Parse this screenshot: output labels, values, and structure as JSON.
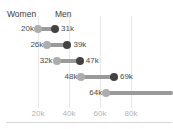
{
  "chart_data": {
    "type": "bar",
    "subtype": "dumbbell-range",
    "title": "",
    "xlabel": "",
    "ylabel": "",
    "xlim": [
      0,
      90000
    ],
    "grid": true,
    "legend_position": "top-inline",
    "categories": [
      "row-1",
      "row-2",
      "row-3",
      "row-4",
      "row-5"
    ],
    "series": [
      {
        "name": "Women",
        "color": "#adadad",
        "values": [
          20000,
          26000,
          32000,
          48000,
          64000
        ]
      },
      {
        "name": "Men",
        "color": "#434343",
        "values": [
          31000,
          39000,
          47000,
          69000,
          null
        ]
      }
    ],
    "point_labels": {
      "women": [
        "20k",
        "26k",
        "32k",
        "48k",
        "64k"
      ],
      "men": [
        "31k",
        "39k",
        "47k",
        "69k",
        ""
      ]
    },
    "xticks": [
      20000,
      40000,
      60000,
      80000
    ],
    "xticklabels": [
      "20k",
      "40k",
      "60k",
      "80k"
    ]
  },
  "legend": {
    "women_label": "Women",
    "men_label": "Men"
  },
  "rows": [
    {
      "women_label": "20k",
      "men_label": "31k"
    },
    {
      "women_label": "26k",
      "men_label": "39k"
    },
    {
      "women_label": "32k",
      "men_label": "47k"
    },
    {
      "women_label": "48k",
      "men_label": "69k"
    },
    {
      "women_label": "64k",
      "men_label": ""
    }
  ],
  "axis": {
    "ticks": [
      "20k",
      "40k",
      "60k",
      "80k"
    ]
  },
  "colors": {
    "women_dot": "#adadad",
    "men_dot": "#434343",
    "connector": "#9a9a9a",
    "gridline": "#e8e8e8",
    "tick_text": "#b4b4b4",
    "value_text": "#4a4a4a",
    "legend_text": "#3d3d3d",
    "background": "#ffffff"
  }
}
